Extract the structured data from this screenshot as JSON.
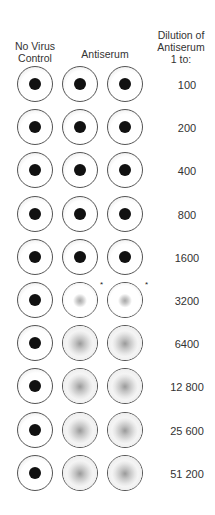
{
  "headers": {
    "control": [
      "No Virus",
      "Control"
    ],
    "antiserum": "Antiserum",
    "dilution": [
      "Dilution of",
      "Antiserum",
      "1 to:"
    ]
  },
  "rows": [
    {
      "dilution": "100",
      "wells": [
        "button",
        "button",
        "button"
      ],
      "asterisk": false
    },
    {
      "dilution": "200",
      "wells": [
        "button",
        "button",
        "button"
      ],
      "asterisk": false
    },
    {
      "dilution": "400",
      "wells": [
        "button",
        "button",
        "button"
      ],
      "asterisk": false
    },
    {
      "dilution": "800",
      "wells": [
        "button",
        "button",
        "button"
      ],
      "asterisk": false
    },
    {
      "dilution": "1600",
      "wells": [
        "button",
        "button",
        "button"
      ],
      "asterisk": false
    },
    {
      "dilution": "3200",
      "wells": [
        "button",
        "faint",
        "faint"
      ],
      "asterisk": true
    },
    {
      "dilution": "6400",
      "wells": [
        "button",
        "diffuse",
        "diffuse"
      ],
      "asterisk": false
    },
    {
      "dilution": "12 800",
      "wells": [
        "button",
        "diffuse",
        "diffuse"
      ],
      "asterisk": false
    },
    {
      "dilution": "25 600",
      "wells": [
        "button",
        "diffuse",
        "diffuse"
      ],
      "asterisk": false
    },
    {
      "dilution": "51 200",
      "wells": [
        "button",
        "diffuse",
        "diffuse"
      ],
      "asterisk": false
    }
  ],
  "asterisk_symbol": "*",
  "colors": {
    "button": "#111111",
    "outline": "#555555",
    "diffuse": "#9a9a9a"
  }
}
